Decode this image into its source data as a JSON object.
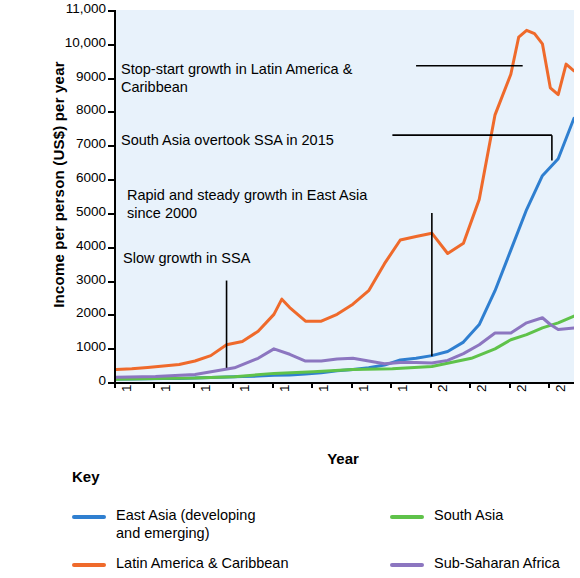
{
  "chart_data": {
    "type": "line",
    "title": "",
    "xlabel": "Year",
    "ylabel": "Income per person (US$) per year",
    "xlim": [
      1960,
      2018
    ],
    "ylim": [
      0,
      11000
    ],
    "grid": false,
    "legend_position": "bottom",
    "y_ticks": [
      "0",
      "1000",
      "2000",
      "3000",
      "4000",
      "5000",
      "6000",
      "7000",
      "8000",
      "9000",
      "10,000",
      "11,000"
    ],
    "y_tick_values": [
      0,
      1000,
      2000,
      3000,
      4000,
      5000,
      6000,
      7000,
      8000,
      9000,
      10000,
      11000
    ],
    "x_ticks": [
      "1960",
      "1965",
      "1970",
      "1975",
      "1980",
      "1985",
      "1990",
      "1995",
      "2000",
      "2005",
      "2010",
      "2015"
    ],
    "x_tick_values": [
      1960,
      1965,
      1970,
      1975,
      1980,
      1985,
      1990,
      1995,
      2000,
      2005,
      2010,
      2015
    ],
    "series": [
      {
        "name": "East Asia (developing and emerging)",
        "color": "#2f7fd0",
        "x": [
          1960,
          1962,
          1964,
          1966,
          1968,
          1970,
          1972,
          1974,
          1976,
          1978,
          1980,
          1982,
          1984,
          1986,
          1988,
          1990,
          1992,
          1994,
          1996,
          1998,
          2000,
          2002,
          2004,
          2006,
          2008,
          2010,
          2012,
          2014,
          2016,
          2018
        ],
        "values": [
          90,
          90,
          95,
          100,
          105,
          115,
          130,
          150,
          160,
          175,
          200,
          210,
          240,
          270,
          330,
          370,
          420,
          500,
          650,
          700,
          780,
          900,
          1180,
          1700,
          2700,
          3900,
          5100,
          6100,
          6600,
          7800
        ]
      },
      {
        "name": "Latin America & Caribbean",
        "color": "#ef6a2b",
        "x": [
          1960,
          1962,
          1964,
          1966,
          1968,
          1970,
          1972,
          1974,
          1976,
          1978,
          1980,
          1981,
          1982,
          1984,
          1986,
          1988,
          1990,
          1992,
          1994,
          1996,
          1998,
          2000,
          2002,
          2004,
          2006,
          2008,
          2010,
          2011,
          2012,
          2013,
          2014,
          2015,
          2016,
          2017,
          2018
        ],
        "values": [
          370,
          390,
          430,
          470,
          520,
          620,
          780,
          1100,
          1200,
          1500,
          2000,
          2450,
          2200,
          1800,
          1800,
          2000,
          2300,
          2700,
          3500,
          4200,
          4300,
          4400,
          3800,
          4100,
          5400,
          7900,
          9100,
          10200,
          10400,
          10300,
          10000,
          8700,
          8500,
          9400,
          9200
        ]
      },
      {
        "name": "South Asia",
        "color": "#5fc24a",
        "x": [
          1960,
          1965,
          1970,
          1975,
          1980,
          1985,
          1990,
          1995,
          2000,
          2005,
          2008,
          2010,
          2012,
          2014,
          2016,
          2018
        ],
        "values": [
          85,
          105,
          115,
          155,
          255,
          300,
          370,
          390,
          460,
          700,
          980,
          1250,
          1400,
          1600,
          1750,
          1950
        ]
      },
      {
        "name": "Sub-Saharan Africa",
        "color": "#8c76c0",
        "x": [
          1960,
          1965,
          1970,
          1975,
          1978,
          1980,
          1982,
          1984,
          1986,
          1988,
          1990,
          1992,
          1994,
          1996,
          1998,
          2000,
          2002,
          2004,
          2006,
          2008,
          2010,
          2012,
          2014,
          2015,
          2016,
          2018
        ],
        "values": [
          140,
          160,
          220,
          420,
          700,
          980,
          820,
          620,
          620,
          680,
          700,
          620,
          540,
          580,
          580,
          560,
          640,
          840,
          1100,
          1450,
          1450,
          1750,
          1900,
          1700,
          1550,
          1600
        ]
      }
    ],
    "annotations": [
      {
        "text": "Stop-start growth in Latin America &\nCaribbean",
        "leader_from_year": 2010,
        "leader_to_value": 9300
      },
      {
        "text": "South Asia overtook SSA in 2015",
        "leader_from_year": 2015,
        "leader_to_value": 7300
      },
      {
        "text": "Rapid and steady growth in East Asia\nsince 2000",
        "leader_from_year": 2000,
        "leader_to_value": 5000
      },
      {
        "text": "Slow growth in SSA",
        "leader_from_year": 1975,
        "leader_to_value": 3000
      }
    ]
  },
  "axis": {
    "y_title": "Income per person (US$) per year",
    "x_title": "Year",
    "y_ticks": [
      "11,000",
      "10,000",
      "9000",
      "8000",
      "7000",
      "6000",
      "5000",
      "4000",
      "3000",
      "2000",
      "1000",
      "0"
    ],
    "x_ticks": [
      "1960",
      "1965",
      "1970",
      "1975",
      "1980",
      "1985",
      "1990",
      "1995",
      "2000",
      "2005",
      "2010",
      "2015"
    ]
  },
  "annotations": [
    {
      "id": "latam",
      "text": "Stop-start growth in Latin America &\nCaribbean"
    },
    {
      "id": "southasia",
      "text": "South Asia overtook SSA in 2015"
    },
    {
      "id": "eastasia",
      "text": "Rapid and steady growth in East Asia\nsince 2000"
    },
    {
      "id": "ssa",
      "text": "Slow growth in SSA"
    }
  ],
  "key": {
    "title": "Key",
    "items": [
      {
        "label": "East Asia (developing\nand emerging)",
        "color": "#2f7fd0"
      },
      {
        "label": "South Asia",
        "color": "#5fc24a"
      },
      {
        "label": "Latin America & Caribbean",
        "color": "#ef6a2b"
      },
      {
        "label": "Sub-Saharan Africa",
        "color": "#8c76c0"
      }
    ]
  }
}
